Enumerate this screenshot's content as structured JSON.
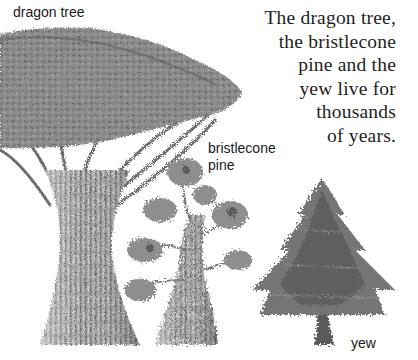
{
  "labels": {
    "dragon_tree": "dragon tree",
    "bristlecone_line1": "bristlecone",
    "bristlecone_line2": "pine",
    "yew": "yew"
  },
  "caption": {
    "lines": [
      "The dragon tree,",
      "the bristlecone",
      "pine and the",
      "yew live for",
      "thousands",
      "of years."
    ]
  },
  "colors": {
    "background": "#ffffff",
    "text": "#1a1a1a",
    "foliage_dark": "#5a5a5a",
    "foliage_mid": "#8a8a8a",
    "foliage_light": "#b5b5b5",
    "trunk_dark": "#6a6a6a",
    "trunk_light": "#c8c8c8"
  },
  "illustration": {
    "trees": [
      "dragon-tree",
      "bristlecone-pine",
      "yew"
    ]
  }
}
